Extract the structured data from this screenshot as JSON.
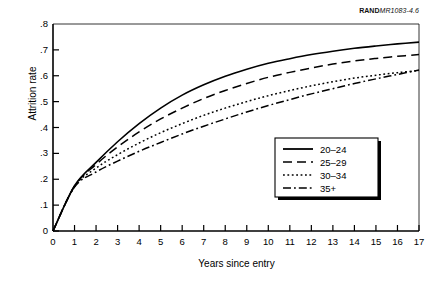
{
  "credit": {
    "brand": "RAND",
    "code": "MR1083-4.6"
  },
  "chart_data": {
    "type": "line",
    "title": "",
    "xlabel": "Years since entry",
    "ylabel": "Attrition rate",
    "xlim": [
      0,
      17
    ],
    "ylim": [
      0,
      0.8
    ],
    "grid": false,
    "legend_position": "bottom-right",
    "xticks": [
      "0",
      "1",
      "2",
      "3",
      "4",
      "5",
      "6",
      "7",
      "8",
      "9",
      "10",
      "11",
      "12",
      "13",
      "14",
      "15",
      "16",
      "17"
    ],
    "yticks": [
      ".8",
      ".7",
      ".6",
      ".5",
      ".4",
      ".3",
      ".2",
      ".1",
      "0"
    ],
    "x": [
      0,
      1,
      2,
      3,
      4,
      5,
      6,
      7,
      8,
      9,
      10,
      11,
      12,
      13,
      14,
      15,
      16,
      17
    ],
    "series": [
      {
        "name": "20-24",
        "label": "20–24",
        "style": "solid",
        "values": [
          0.0,
          0.175,
          0.265,
          0.345,
          0.415,
          0.475,
          0.525,
          0.565,
          0.598,
          0.625,
          0.648,
          0.666,
          0.682,
          0.695,
          0.706,
          0.715,
          0.723,
          0.73
        ]
      },
      {
        "name": "25-29",
        "label": "25–29",
        "style": "dashed",
        "values": [
          0.0,
          0.173,
          0.257,
          0.325,
          0.383,
          0.433,
          0.475,
          0.512,
          0.543,
          0.57,
          0.594,
          0.613,
          0.63,
          0.645,
          0.657,
          0.667,
          0.675,
          0.682
        ]
      },
      {
        "name": "30-34",
        "label": "30–34",
        "style": "dotted",
        "values": [
          0.0,
          0.172,
          0.243,
          0.295,
          0.34,
          0.38,
          0.415,
          0.447,
          0.475,
          0.5,
          0.523,
          0.543,
          0.561,
          0.577,
          0.591,
          0.602,
          0.612,
          0.62
        ]
      },
      {
        "name": "35+",
        "label": "35+",
        "style": "dashdot",
        "values": [
          0.0,
          0.17,
          0.228,
          0.27,
          0.308,
          0.342,
          0.375,
          0.405,
          0.433,
          0.46,
          0.485,
          0.508,
          0.53,
          0.55,
          0.57,
          0.588,
          0.605,
          0.622
        ]
      }
    ],
    "legend": [
      {
        "label": "20–24",
        "style": "solid"
      },
      {
        "label": "25–29",
        "style": "dashed"
      },
      {
        "label": "30–34",
        "style": "dotted"
      },
      {
        "label": "35+",
        "style": "dashdot"
      }
    ]
  }
}
